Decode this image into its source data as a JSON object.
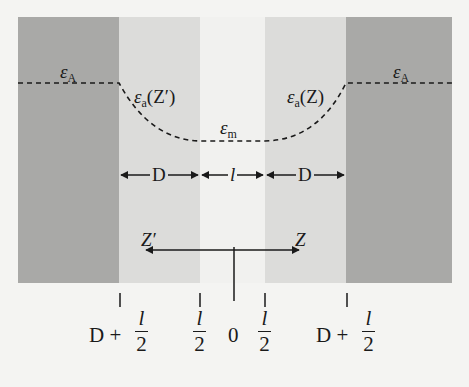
{
  "diagram": {
    "regions": [
      {
        "name": "left-bulk",
        "shade": "#a9a9a7"
      },
      {
        "name": "left-adsorbed-layer",
        "shade": "#dcdcda"
      },
      {
        "name": "medium-gap",
        "shade": "#f1f1ef"
      },
      {
        "name": "right-adsorbed-layer",
        "shade": "#dcdcda"
      },
      {
        "name": "right-bulk",
        "shade": "#a9a9a7"
      }
    ],
    "labels": {
      "eps_left": {
        "symbol": "ε",
        "sub": "A"
      },
      "eps_right": {
        "symbol": "ε",
        "sub": "A"
      },
      "eps_a_left": {
        "symbol": "ε",
        "sub": "a",
        "arg": "(Z′)"
      },
      "eps_a_right": {
        "symbol": "ε",
        "sub": "a",
        "arg": "(Z)"
      },
      "eps_m": {
        "symbol": "ε",
        "sub": "m"
      }
    },
    "dimensions": {
      "left_D": "D",
      "middle_l": "l",
      "right_D": "D"
    },
    "axis": {
      "left_label": "Z′",
      "right_label": "Z"
    },
    "ticks": [
      {
        "prefix": "D +",
        "num": "l",
        "den": "2"
      },
      {
        "prefix": "",
        "num": "l",
        "den": "2"
      },
      {
        "prefix": "",
        "value": "0"
      },
      {
        "prefix": "",
        "num": "l",
        "den": "2"
      },
      {
        "prefix": "D +",
        "num": "l",
        "den": "2"
      }
    ]
  }
}
